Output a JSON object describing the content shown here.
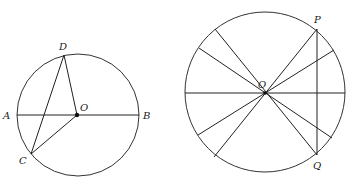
{
  "figure_left": {
    "circle": {
      "cx": 78,
      "cy": 115,
      "r": 61
    },
    "points": {
      "A": {
        "x": 17,
        "y": 115,
        "label": "A"
      },
      "B": {
        "x": 139,
        "y": 115,
        "label": "B"
      },
      "O": {
        "x": 77,
        "y": 115,
        "label": "O"
      },
      "D": {
        "x": 64,
        "y": 55,
        "label": "D"
      },
      "C": {
        "x": 31,
        "y": 154,
        "label": "C"
      }
    },
    "segments": [
      [
        "A",
        "B"
      ],
      [
        "D",
        "O"
      ],
      [
        "D",
        "C"
      ],
      [
        "C",
        "O"
      ]
    ]
  },
  "figure_right": {
    "circle": {
      "cx": 265,
      "cy": 92,
      "r": 80
    },
    "points": {
      "O": {
        "x": 265,
        "y": 93,
        "label": "O"
      },
      "P": {
        "x": 317,
        "y": 29,
        "label": "P"
      },
      "Q": {
        "x": 317,
        "y": 155,
        "label": "Q"
      }
    },
    "chord_PQ": [
      "P",
      "Q"
    ],
    "diameters": [
      {
        "x1": 185,
        "y1": 93,
        "x2": 345,
        "y2": 93
      },
      {
        "x1": 317,
        "y1": 29,
        "x2": 214,
        "y2": 157
      },
      {
        "x1": 317,
        "y1": 155,
        "x2": 215,
        "y2": 29
      },
      {
        "x1": 334,
        "y1": 50,
        "x2": 198,
        "y2": 135
      },
      {
        "x1": 332,
        "y1": 138,
        "x2": 199,
        "y2": 48
      }
    ]
  }
}
